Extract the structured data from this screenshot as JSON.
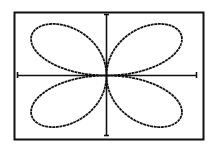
{
  "chart_data": {
    "type": "line",
    "title": "",
    "xlabel": "",
    "ylabel": "",
    "equation": "r = sin(2θ)",
    "petals": 4,
    "grid": false,
    "legend": null,
    "axes": {
      "x_visible": true,
      "y_visible": true,
      "ticks": true
    },
    "colors": {
      "background": "#ffffff",
      "curve": "#111111",
      "axes": "#111111",
      "frame": "#111111"
    }
  }
}
